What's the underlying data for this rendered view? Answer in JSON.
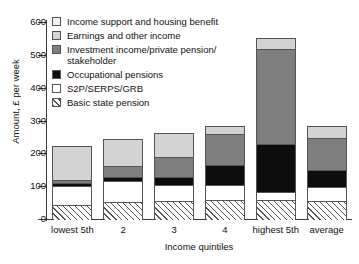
{
  "chart": {
    "type": "bar",
    "title": "",
    "xlabel": "Income quintiles",
    "ylabel": "Amount, £ per week"
  },
  "axis": {
    "y_title": "Amount, £ per week",
    "x_title": "Income quintiles",
    "y_ticks": [
      "0",
      "100",
      "200",
      "300",
      "400",
      "500",
      "600"
    ]
  },
  "legend": {
    "items": [
      {
        "label": "Income support and housing benefit",
        "key": "income_support_housing_benefit",
        "swatch": "swatch-very-light-gray",
        "color": "#f2f2f2"
      },
      {
        "label": "Earnings and other income",
        "key": "earnings_and_other_income",
        "swatch": "swatch-light-gray",
        "color": "#d3d3d3"
      },
      {
        "label": "Investment income/private pension/\nstakeholder",
        "key": "investment_private_pension_stakeholder",
        "swatch": "swatch-dark-gray",
        "color": "#7e7e7e"
      },
      {
        "label": "Occupational pensions",
        "key": "occupational_pensions",
        "swatch": "swatch-black",
        "color": "#0d0d0d"
      },
      {
        "label": "S2P/SERPS/GRB",
        "key": "s2p_serps_grb",
        "swatch": "swatch-white",
        "color": "#ffffff"
      },
      {
        "label": "Basic state pension",
        "key": "basic_state_pension",
        "swatch": "swatch-hatched",
        "color": "#ffffff"
      }
    ]
  },
  "chart_data": {
    "type": "bar",
    "subtype": "stacked-vertical",
    "title": "",
    "xlabel": "Income quintiles",
    "ylabel": "Amount, £ per week",
    "ylim": [
      0,
      600
    ],
    "yticks": [
      0,
      100,
      200,
      300,
      400,
      500,
      600
    ],
    "grid": false,
    "legend_position": "inside-top-left",
    "categories": [
      "lowest 5th",
      "2",
      "3",
      "4",
      "highest 5th",
      "average"
    ],
    "series": [
      {
        "name": "Basic state pension",
        "color": "#ffffff",
        "pattern": "diagonal-hatch",
        "values": [
          45,
          55,
          58,
          60,
          60,
          57
        ]
      },
      {
        "name": "S2P/SERPS/GRB",
        "color": "#ffffff",
        "values": [
          58,
          65,
          50,
          47,
          25,
          45
        ]
      },
      {
        "name": "Occupational pensions",
        "color": "#0d0d0d",
        "values": [
          10,
          10,
          23,
          60,
          145,
          50
        ]
      },
      {
        "name": "Investment income/private pension/stakeholder",
        "color": "#7e7e7e",
        "values": [
          8,
          35,
          60,
          95,
          290,
          98
        ]
      },
      {
        "name": "Earnings and other income",
        "color": "#d3d3d3",
        "values": [
          100,
          80,
          72,
          20,
          30,
          32
        ]
      },
      {
        "name": "Income support and housing benefit",
        "color": "#f2f2f2",
        "values": [
          0,
          0,
          0,
          0,
          0,
          0
        ]
      }
    ],
    "totals": [
      221,
      245,
      263,
      282,
      550,
      282
    ]
  },
  "bars": [
    {
      "category": "lowest 5th",
      "total": 221,
      "segments": [
        {
          "key": "earnings_and_other_income",
          "value": 100,
          "css": "sw-earn"
        },
        {
          "key": "investment_private_pension_stakeholder",
          "value": 8,
          "css": "sw-inv"
        },
        {
          "key": "occupational_pensions",
          "value": 10,
          "css": "sw-occ"
        },
        {
          "key": "s2p_serps_grb",
          "value": 58,
          "css": "sw-s2p"
        },
        {
          "key": "basic_state_pension",
          "value": 45,
          "css": "sw-basic"
        }
      ]
    },
    {
      "category": "2",
      "total": 245,
      "segments": [
        {
          "key": "earnings_and_other_income",
          "value": 80,
          "css": "sw-earn"
        },
        {
          "key": "investment_private_pension_stakeholder",
          "value": 35,
          "css": "sw-inv"
        },
        {
          "key": "occupational_pensions",
          "value": 10,
          "css": "sw-occ"
        },
        {
          "key": "s2p_serps_grb",
          "value": 65,
          "css": "sw-s2p"
        },
        {
          "key": "basic_state_pension",
          "value": 55,
          "css": "sw-basic"
        }
      ]
    },
    {
      "category": "3",
      "total": 263,
      "segments": [
        {
          "key": "earnings_and_other_income",
          "value": 72,
          "css": "sw-earn"
        },
        {
          "key": "investment_private_pension_stakeholder",
          "value": 60,
          "css": "sw-inv"
        },
        {
          "key": "occupational_pensions",
          "value": 23,
          "css": "sw-occ"
        },
        {
          "key": "s2p_serps_grb",
          "value": 50,
          "css": "sw-s2p"
        },
        {
          "key": "basic_state_pension",
          "value": 58,
          "css": "sw-basic"
        }
      ]
    },
    {
      "category": "4",
      "total": 282,
      "segments": [
        {
          "key": "earnings_and_other_income",
          "value": 20,
          "css": "sw-earn"
        },
        {
          "key": "investment_private_pension_stakeholder",
          "value": 95,
          "css": "sw-inv"
        },
        {
          "key": "occupational_pensions",
          "value": 60,
          "css": "sw-occ"
        },
        {
          "key": "s2p_serps_grb",
          "value": 47,
          "css": "sw-s2p"
        },
        {
          "key": "basic_state_pension",
          "value": 60,
          "css": "sw-basic"
        }
      ]
    },
    {
      "category": "highest 5th",
      "total": 550,
      "segments": [
        {
          "key": "earnings_and_other_income",
          "value": 30,
          "css": "sw-earn"
        },
        {
          "key": "investment_private_pension_stakeholder",
          "value": 290,
          "css": "sw-inv"
        },
        {
          "key": "occupational_pensions",
          "value": 145,
          "css": "sw-occ"
        },
        {
          "key": "s2p_serps_grb",
          "value": 25,
          "css": "sw-s2p"
        },
        {
          "key": "basic_state_pension",
          "value": 60,
          "css": "sw-basic"
        }
      ]
    },
    {
      "category": "average",
      "total": 282,
      "segments": [
        {
          "key": "earnings_and_other_income",
          "value": 32,
          "css": "sw-earn"
        },
        {
          "key": "investment_private_pension_stakeholder",
          "value": 98,
          "css": "sw-inv"
        },
        {
          "key": "occupational_pensions",
          "value": 50,
          "css": "sw-occ"
        },
        {
          "key": "s2p_serps_grb",
          "value": 45,
          "css": "sw-s2p"
        },
        {
          "key": "basic_state_pension",
          "value": 57,
          "css": "sw-basic"
        }
      ]
    }
  ]
}
